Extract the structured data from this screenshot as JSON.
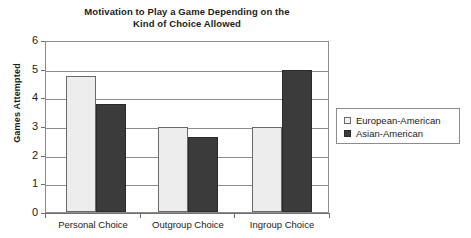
{
  "chart_data": {
    "type": "bar",
    "title": "Motivation to Play a Game Depending on the Kind of Choice Allowed",
    "title_lines": [
      "Motivation to Play a Game Depending on the",
      "Kind of Choice Allowed"
    ],
    "xlabel": "",
    "ylabel": "Games Attempted",
    "ylim": [
      0,
      6
    ],
    "ytick_labels": [
      "0",
      "1",
      "2",
      "3",
      "4",
      "5",
      "6"
    ],
    "ytick_values": [
      0,
      1,
      2,
      3,
      4,
      5,
      6
    ],
    "grid": true,
    "grid_axis": "y",
    "legend_position": "right",
    "categories": [
      "Personal Choice",
      "Outgroup Choice",
      "Ingroup Choice"
    ],
    "series": [
      {
        "name": "European-American",
        "color": "#ededed",
        "edge_color": "#6a6a6a",
        "values": [
          4.8,
          3.0,
          3.0
        ]
      },
      {
        "name": "Asian-American",
        "color": "#3b3b3b",
        "edge_color": "#2a2a2a",
        "values": [
          3.8,
          2.65,
          5.0
        ]
      }
    ]
  },
  "axes": {
    "y_title": "Games Attempted",
    "y_ticks": [
      {
        "label": "6",
        "value": 6
      },
      {
        "label": "5",
        "value": 5
      },
      {
        "label": "4",
        "value": 4
      },
      {
        "label": "3",
        "value": 3
      },
      {
        "label": "2",
        "value": 2
      },
      {
        "label": "1",
        "value": 1
      },
      {
        "label": "0",
        "value": 0
      }
    ],
    "x_ticks": [
      {
        "label": "Personal Choice"
      },
      {
        "label": "Outgroup Choice"
      },
      {
        "label": "Ingroup Choice"
      }
    ]
  },
  "legend": {
    "entries": [
      {
        "label": "European-American",
        "swatch": "light"
      },
      {
        "label": "Asian-American",
        "swatch": "dark"
      }
    ]
  },
  "colors": {
    "series_light": "#ededed",
    "series_dark": "#3b3b3b",
    "axis": "#6f6f6f",
    "grid": "#8d8d8d",
    "text": "#1a1a1a",
    "background": "#ffffff"
  }
}
